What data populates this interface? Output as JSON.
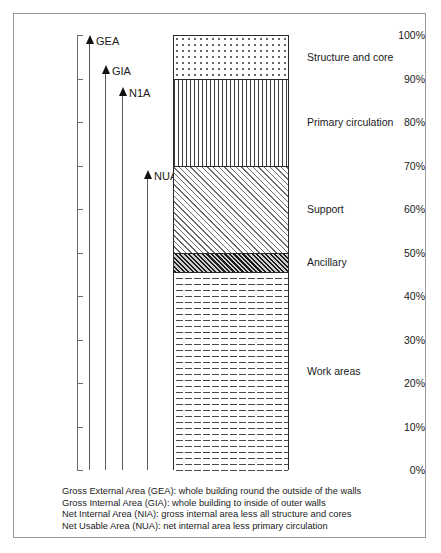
{
  "chart_data": {
    "type": "bar",
    "title": "",
    "subtitle": "",
    "xlabel": "",
    "ylabel": "",
    "ylim": [
      0,
      100
    ],
    "grid": false,
    "legend_position": "right",
    "stacked": true,
    "categories": [
      "Building area"
    ],
    "axis_ticks": [
      {
        "label": "100%",
        "value": 100
      },
      {
        "label": "90%",
        "value": 90
      },
      {
        "label": "80%",
        "value": 80
      },
      {
        "label": "70%",
        "value": 70
      },
      {
        "label": "60%",
        "value": 60
      },
      {
        "label": "50%",
        "value": 50
      },
      {
        "label": "40%",
        "value": 40
      },
      {
        "label": "30%",
        "value": 30
      },
      {
        "label": "20%",
        "value": 20
      },
      {
        "label": "10%",
        "value": 10
      },
      {
        "label": "0%",
        "value": 0
      }
    ],
    "series": [
      {
        "name": "Structure and core",
        "from": 90,
        "to": 100,
        "value": 10,
        "pattern": "dots"
      },
      {
        "name": "Primary circulation",
        "from": 70,
        "to": 90,
        "value": 20,
        "pattern": "vertical-stripes"
      },
      {
        "name": "Support",
        "from": 50,
        "to": 70,
        "value": 20,
        "pattern": "diagonal-hatch-light"
      },
      {
        "name": "Ancillary",
        "from": 45.5,
        "to": 50,
        "value": 4.5,
        "pattern": "diagonal-hatch-dark"
      },
      {
        "name": "Work areas",
        "from": 0,
        "to": 45.5,
        "value": 45.5,
        "pattern": "dashed-brick"
      }
    ],
    "annotations": [
      {
        "name": "GEA",
        "label": "GEA",
        "from": 0,
        "to": 100
      },
      {
        "name": "GIA",
        "label": "GIA",
        "from": 0,
        "to": 93
      },
      {
        "name": "NIA",
        "label": "N1A",
        "from": 0,
        "to": 88
      },
      {
        "name": "NUA",
        "label": "NUA",
        "from": 0,
        "to": 69
      }
    ]
  },
  "caption": {
    "lines": [
      "Gross External Area (GEA): whole building round the outside of the walls",
      "Gross Internal Area (GIA): whole building to inside of outer walls",
      "Net Internal Area (NIA): gross internal area less all structure and cores",
      "Net Usable Area (NUA): net internal area less primary circulation"
    ]
  }
}
